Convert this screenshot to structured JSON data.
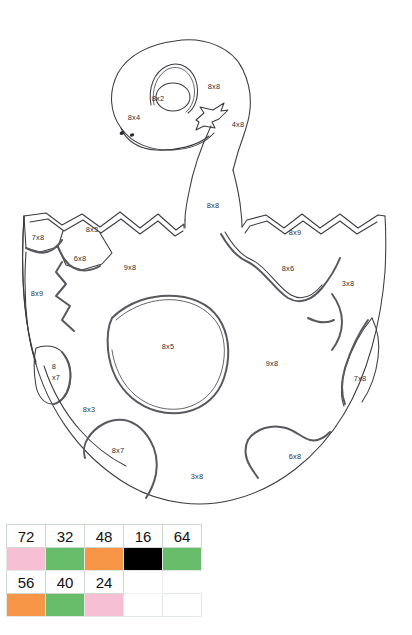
{
  "artwork": {
    "title_alt": "Dinosaur hatching from a cracked egg colour-by-multiplication picture",
    "labels": [
      {
        "id": "head-eye",
        "text": "8x2",
        "x": 170,
        "y": 98,
        "region": "eye"
      },
      {
        "id": "head-crown",
        "text": "8x8",
        "x": 208,
        "y": 88,
        "region": "head-top"
      },
      {
        "id": "head-cheek",
        "text": "8x4",
        "x": 129,
        "y": 118,
        "region": "head-side"
      },
      {
        "id": "head-jaw",
        "text": "4x8",
        "x": 230,
        "y": 125,
        "region": "mouth"
      },
      {
        "id": "neck",
        "text": "8x8",
        "x": 212,
        "y": 207,
        "region": "neck"
      },
      {
        "id": "shell-top-left",
        "text": "8x3",
        "x": 84,
        "y": 231,
        "region": "shell-rim-left"
      },
      {
        "id": "shell-far-left",
        "text": "7x8",
        "x": 36,
        "y": 239,
        "region": "shell-rim-corner-left"
      },
      {
        "id": "shell-left-tooth",
        "text": "6x8",
        "x": 74,
        "y": 259,
        "region": "shell-rim-tooth"
      },
      {
        "id": "shell-top-right",
        "text": "8x9",
        "x": 289,
        "y": 234,
        "region": "shell-rim-right"
      },
      {
        "id": "shell-body-left",
        "text": "9x8",
        "x": 123,
        "y": 269,
        "region": "shell-body-upper-left"
      },
      {
        "id": "shell-body-right",
        "text": "8x6",
        "x": 281,
        "y": 270,
        "region": "shell-body-upper-right"
      },
      {
        "id": "shell-right-edge",
        "text": "3x8",
        "x": 344,
        "y": 285,
        "region": "shell-right-flake"
      },
      {
        "id": "shell-left-edge",
        "text": "8x9",
        "x": 33,
        "y": 294,
        "region": "shell-left-flake"
      },
      {
        "id": "shell-centre",
        "text": "8x5",
        "x": 164,
        "y": 347,
        "region": "shell-centre-blob"
      },
      {
        "id": "shell-mid-right",
        "text": "9x8",
        "x": 266,
        "y": 364,
        "region": "shell-body-lower-right"
      },
      {
        "id": "shell-small-a",
        "text": "8",
        "x": 52,
        "y": 367,
        "region": "shell-left-sliver-line1"
      },
      {
        "id": "shell-small-b",
        "text": "x7",
        "x": 53,
        "y": 379,
        "region": "shell-left-sliver-line2"
      },
      {
        "id": "shell-right-tab",
        "text": "7x8",
        "x": 355,
        "y": 379,
        "region": "shell-right-sliver"
      },
      {
        "id": "shell-low-left",
        "text": "8x3",
        "x": 82,
        "y": 411,
        "region": "shell-lower-left"
      },
      {
        "id": "shell-bot-left",
        "text": "8x7",
        "x": 112,
        "y": 451,
        "region": "shell-bottom-blob-left"
      },
      {
        "id": "shell-bot-mid",
        "text": "3x8",
        "x": 192,
        "y": 477,
        "region": "shell-bottom-centre"
      },
      {
        "id": "shell-bot-right",
        "text": "6x8",
        "x": 289,
        "y": 457,
        "region": "shell-bottom-blob-right"
      }
    ]
  },
  "legend": {
    "caption": "",
    "colors": {
      "pink": "#f6bfd4",
      "green": "#68bd6a",
      "orange": "#f79646",
      "black": "#000000",
      "white": "#ffffff"
    },
    "rows": [
      {
        "numbers": [
          "72",
          "32",
          "48",
          "16",
          "64"
        ],
        "swatches": [
          "pink",
          "green",
          "orange",
          "black",
          "green"
        ]
      },
      {
        "numbers": [
          "56",
          "40",
          "24",
          ""
        ],
        "swatches": [
          "orange",
          "green",
          "pink",
          "white"
        ]
      }
    ]
  }
}
